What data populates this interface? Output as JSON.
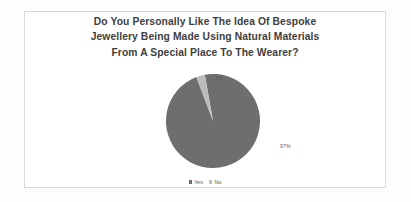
{
  "chart_data": {
    "type": "pie",
    "title": "Do You Personally Like The Idea Of Bespoke Jewellery Being Made Using Natural Materials From A Special Place To The Wearer?",
    "title_lines": [
      "Do You Personally Like The Idea Of Bespoke",
      "Jewellery Being Made Using Natural Materials",
      "From A Special Place To The Wearer?"
    ],
    "categories": [
      "Yes",
      "No"
    ],
    "values": [
      97,
      3
    ],
    "data_labels": [
      "97%",
      "3%"
    ],
    "colors": [
      "#6e6e6e",
      "#bcbcbc"
    ],
    "legend_position": "bottom",
    "xlabel": "",
    "ylabel": "",
    "start_angle": -10
  },
  "legend": {
    "items": [
      {
        "label": "Yes",
        "color": "#6e6e6e"
      },
      {
        "label": "No",
        "color": "#bcbcbc"
      }
    ]
  },
  "labels": {
    "yes_pct": "97%",
    "no_pct": "3%"
  }
}
